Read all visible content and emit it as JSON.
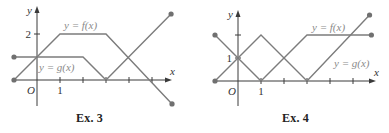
{
  "colors": {
    "curve": "#7c7c7c",
    "axis": "#3a3a3a",
    "label": "#8a8a8a",
    "tick_text": "#333333",
    "dot": "#707070"
  },
  "chart_data": [
    {
      "type": "line",
      "title": "Ex. 3",
      "caption": "Ex. 3",
      "xlabel": "x",
      "ylabel": "y",
      "origin_label": "O",
      "x_ticks": [
        1,
        2,
        3,
        4,
        5
      ],
      "x_tick_labels": [
        {
          "value": 1,
          "label": "1"
        }
      ],
      "y_ticks": [
        2
      ],
      "y_tick_labels": [
        {
          "value": 2,
          "label": "2"
        }
      ],
      "xlim": [
        -1,
        6
      ],
      "ylim": [
        -1,
        3
      ],
      "grid": false,
      "legend": "inline labels",
      "pixel_frame": {
        "ox": 37,
        "oy": 80,
        "unit": 23,
        "axis_x_end": 172,
        "axis_y_top": 6,
        "axis_y_bottom": 106,
        "axis_x_start": 12
      },
      "series": [
        {
          "name": "y = f(x)",
          "label": "y = f(x)",
          "points": [
            [
              -1,
              0
            ],
            [
              1,
              2
            ],
            [
              3,
              2
            ],
            [
              5.87,
              -1.04
            ]
          ],
          "endpoints": [
            [
              -1,
              0
            ],
            [
              5.87,
              -1.04
            ]
          ],
          "label_pos": [
            64,
            29
          ]
        },
        {
          "name": "y = g(x)",
          "label": "y = g(x)",
          "points": [
            [
              -1,
              1
            ],
            [
              2,
              1
            ],
            [
              3,
              0
            ],
            [
              5.83,
              2.87
            ]
          ],
          "endpoints": [
            [
              -1,
              1
            ],
            [
              5.83,
              2.87
            ]
          ],
          "label_pos": [
            39,
            71
          ]
        }
      ]
    },
    {
      "type": "line",
      "title": "Ex. 4",
      "caption": "Ex. 4",
      "xlabel": "x",
      "ylabel": "y",
      "origin_label": "O",
      "x_ticks": [
        1,
        2,
        3,
        4,
        5
      ],
      "x_tick_labels": [
        {
          "value": 1,
          "label": "1"
        }
      ],
      "y_ticks": [
        1,
        2
      ],
      "y_tick_labels": [
        {
          "value": 1,
          "label": "1"
        }
      ],
      "xlim": [
        -1,
        6
      ],
      "ylim": [
        -1,
        3
      ],
      "grid": false,
      "legend": "inline labels",
      "pixel_frame": {
        "ox": 43,
        "oy": 81,
        "unit": 23,
        "axis_x_end": 181,
        "axis_y_top": 10,
        "axis_y_bottom": 106,
        "axis_x_start": 20
      },
      "series": [
        {
          "name": "y = f(x)",
          "label": "y = f(x)",
          "points": [
            [
              -1,
              2
            ],
            [
              1,
              0
            ],
            [
              3,
              2
            ],
            [
              5.8,
              2
            ]
          ],
          "endpoints": [
            [
              -1,
              2
            ],
            [
              5.8,
              2
            ]
          ],
          "label_pos": [
            117,
            31
          ]
        },
        {
          "name": "y = g(x)",
          "label": "y = g(x)",
          "points": [
            [
              -1,
              0
            ],
            [
              1,
              2
            ],
            [
              3,
              0
            ],
            [
              5.72,
              2.87
            ]
          ],
          "endpoints": [
            [
              -1,
              0
            ],
            [
              5.72,
              2.87
            ]
          ],
          "label_pos": [
            139,
            67
          ]
        }
      ]
    }
  ]
}
